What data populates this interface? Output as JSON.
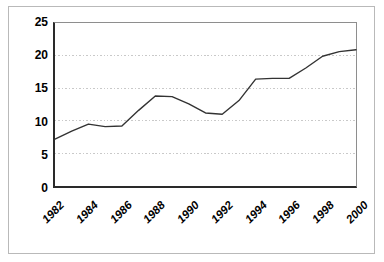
{
  "chart_data": {
    "type": "line",
    "title": "",
    "subtitle": "",
    "xlabel": "",
    "ylabel": "",
    "x": [
      1982,
      1983,
      1984,
      1985,
      1986,
      1987,
      1988,
      1989,
      1990,
      1991,
      1992,
      1993,
      1994,
      1995,
      1996,
      1997,
      1998,
      1999,
      2000
    ],
    "values": [
      7.2,
      8.4,
      9.5,
      9.1,
      9.2,
      11.6,
      13.8,
      13.7,
      12.6,
      11.2,
      11.0,
      13.1,
      16.4,
      16.5,
      16.5,
      18.1,
      19.9,
      20.6,
      20.9
    ],
    "series": [
      {
        "name": "series-1",
        "color": "#333333",
        "values": [
          7.2,
          8.4,
          9.5,
          9.1,
          9.2,
          11.6,
          13.8,
          13.7,
          12.6,
          11.2,
          11.0,
          13.1,
          16.4,
          16.5,
          16.5,
          18.1,
          19.9,
          20.6,
          20.9
        ]
      }
    ],
    "xlim": [
      1982,
      2000
    ],
    "ylim": [
      0,
      25
    ],
    "x_tick_labels": [
      "1982",
      "1984",
      "1986",
      "1988",
      "1990",
      "1992",
      "1994",
      "1996",
      "1998",
      "2000"
    ],
    "x_tick_values": [
      1982,
      1984,
      1986,
      1988,
      1990,
      1992,
      1994,
      1996,
      1998,
      2000
    ],
    "y_tick_labels": [
      "0",
      "5",
      "10",
      "15",
      "20",
      "25"
    ],
    "y_tick_values": [
      0,
      5,
      10,
      15,
      20,
      25
    ],
    "grid": "horizontal-dotted",
    "gridline_values": [
      5,
      10,
      15,
      20,
      25
    ],
    "gridline_color": "#c8c8c8",
    "legend": "none",
    "x_label_rotation_degrees": -45,
    "line_color": "#333333",
    "plot_background": "#ffffff",
    "axis_color": "#2a2a2a",
    "frame_color": "#b9b9b9",
    "markers": "none"
  }
}
